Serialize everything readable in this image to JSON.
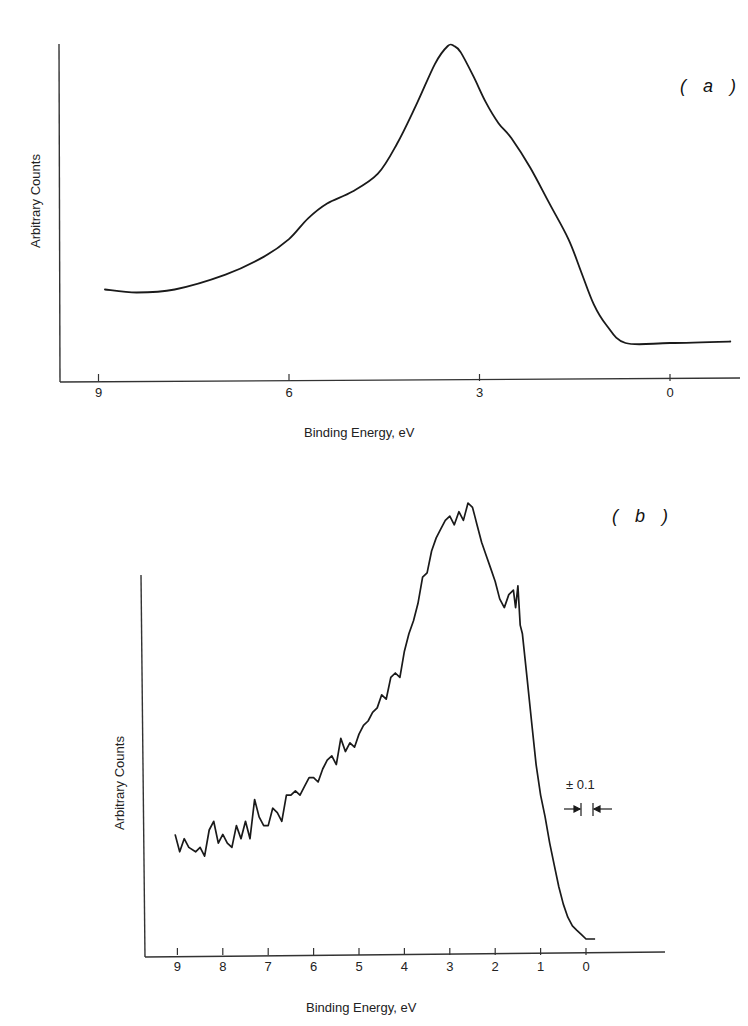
{
  "chart_data": [
    {
      "type": "line",
      "panel": "(a)",
      "xlabel": "Binding Energy, eV",
      "ylabel": "Arbitrary Counts",
      "x_ticks": [
        "9",
        "6",
        "3",
        "0"
      ],
      "xlim": [
        9.6,
        -1.0
      ],
      "x_reversed": true,
      "grid": false,
      "series": [
        {
          "name": "spectrum (a)",
          "style": "smooth",
          "x": [
            8.9,
            8.4,
            7.8,
            7.0,
            6.4,
            6.0,
            5.7,
            5.4,
            5.0,
            4.6,
            4.3,
            4.0,
            3.7,
            3.5,
            3.4,
            3.3,
            3.1,
            2.9,
            2.7,
            2.5,
            2.2,
            1.9,
            1.6,
            1.4,
            1.2,
            1.0,
            0.7,
            0.0,
            -0.95
          ],
          "y": [
            0.18,
            0.17,
            0.18,
            0.23,
            0.29,
            0.35,
            0.42,
            0.47,
            0.51,
            0.57,
            0.67,
            0.8,
            0.94,
            1.0,
            1.0,
            0.98,
            0.9,
            0.81,
            0.74,
            0.69,
            0.59,
            0.47,
            0.35,
            0.24,
            0.13,
            0.06,
            0.0,
            0.0,
            0.005
          ]
        }
      ]
    },
    {
      "type": "line",
      "panel": "(b)",
      "xlabel": "Binding Energy, eV",
      "ylabel": "Arbitrary Counts",
      "x_ticks": [
        "9",
        "8",
        "7",
        "6",
        "5",
        "4",
        "3",
        "2",
        "1",
        "0"
      ],
      "xlim": [
        9.8,
        -1.7
      ],
      "x_reversed": true,
      "grid": false,
      "annotation": "± 0.1",
      "series": [
        {
          "name": "spectrum (b)",
          "style": "noisy",
          "x": [
            9.05,
            8.95,
            8.85,
            8.75,
            8.6,
            8.5,
            8.4,
            8.3,
            8.2,
            8.1,
            8.0,
            7.9,
            7.8,
            7.7,
            7.6,
            7.5,
            7.4,
            7.3,
            7.2,
            7.1,
            7.0,
            6.9,
            6.8,
            6.7,
            6.6,
            6.5,
            6.4,
            6.3,
            6.2,
            6.1,
            6.0,
            5.9,
            5.8,
            5.7,
            5.6,
            5.5,
            5.4,
            5.3,
            5.2,
            5.1,
            5.0,
            4.9,
            4.8,
            4.7,
            4.6,
            4.5,
            4.4,
            4.3,
            4.2,
            4.1,
            4.0,
            3.9,
            3.8,
            3.7,
            3.6,
            3.5,
            3.4,
            3.3,
            3.2,
            3.1,
            3.0,
            2.9,
            2.8,
            2.7,
            2.6,
            2.5,
            2.45,
            2.4,
            2.3,
            2.2,
            2.1,
            2.0,
            1.9,
            1.8,
            1.7,
            1.6,
            1.55,
            1.5,
            1.45,
            1.4,
            1.3,
            1.2,
            1.1,
            1.0,
            0.9,
            0.8,
            0.7,
            0.6,
            0.5,
            0.4,
            0.3,
            0.2,
            0.1,
            0.0,
            -0.1,
            -0.2
          ],
          "y": [
            0.24,
            0.2,
            0.23,
            0.21,
            0.2,
            0.21,
            0.19,
            0.25,
            0.27,
            0.22,
            0.24,
            0.22,
            0.21,
            0.26,
            0.23,
            0.27,
            0.23,
            0.32,
            0.28,
            0.26,
            0.26,
            0.3,
            0.29,
            0.27,
            0.33,
            0.33,
            0.34,
            0.33,
            0.35,
            0.37,
            0.37,
            0.36,
            0.39,
            0.41,
            0.42,
            0.4,
            0.46,
            0.43,
            0.45,
            0.44,
            0.47,
            0.49,
            0.5,
            0.52,
            0.53,
            0.56,
            0.55,
            0.6,
            0.61,
            0.6,
            0.66,
            0.7,
            0.73,
            0.77,
            0.83,
            0.84,
            0.89,
            0.92,
            0.94,
            0.96,
            0.97,
            0.95,
            0.98,
            0.96,
            1.0,
            0.99,
            0.97,
            0.95,
            0.91,
            0.88,
            0.85,
            0.82,
            0.78,
            0.76,
            0.79,
            0.8,
            0.76,
            0.81,
            0.72,
            0.7,
            0.6,
            0.5,
            0.4,
            0.33,
            0.28,
            0.22,
            0.17,
            0.12,
            0.08,
            0.05,
            0.03,
            0.02,
            0.01,
            0.0,
            0.0,
            0.0
          ]
        }
      ]
    }
  ],
  "panel_a": {
    "tag": "( a )",
    "ylabel": "Arbitrary Counts",
    "xlabel": "Binding Energy, eV",
    "ticks": [
      {
        "label": "9",
        "ev": 9
      },
      {
        "label": "6",
        "ev": 6
      },
      {
        "label": "3",
        "ev": 3
      },
      {
        "label": "0",
        "ev": 0
      }
    ]
  },
  "panel_b": {
    "tag": "( b )",
    "ylabel": "Arbitrary Counts",
    "xlabel": "Binding Energy, eV",
    "annotation": "± 0.1",
    "ticks": [
      {
        "label": "9",
        "ev": 9
      },
      {
        "label": "8",
        "ev": 8
      },
      {
        "label": "7",
        "ev": 7
      },
      {
        "label": "6",
        "ev": 6
      },
      {
        "label": "5",
        "ev": 5
      },
      {
        "label": "4",
        "ev": 4
      },
      {
        "label": "3",
        "ev": 3
      },
      {
        "label": "2",
        "ev": 2
      },
      {
        "label": "1",
        "ev": 1
      },
      {
        "label": "0",
        "ev": 0
      }
    ]
  },
  "colors": {
    "ink": "#1a1a1a",
    "axis": "#333333",
    "background": "#ffffff"
  }
}
